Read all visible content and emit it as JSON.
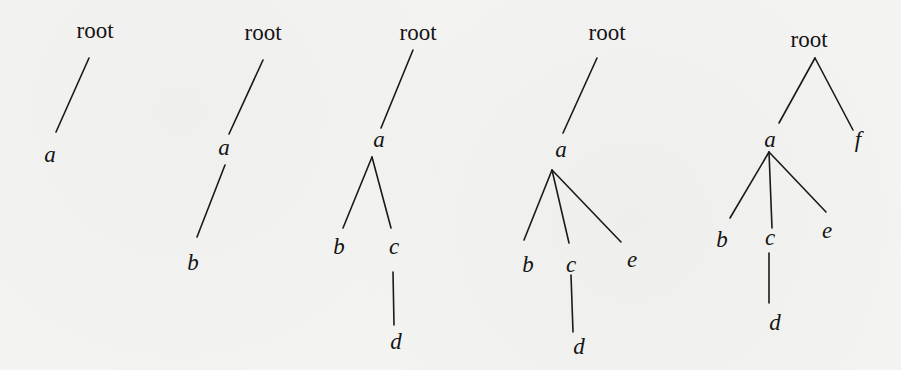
{
  "diagram": {
    "title": "",
    "colors": {
      "background": "#f3f3f1",
      "ink": "#141414"
    },
    "trees": [
      {
        "id": "tree-1",
        "nodes": [
          {
            "id": "root",
            "label": "root",
            "x": 95,
            "y": 38,
            "style": "roman"
          },
          {
            "id": "a",
            "label": "a",
            "x": 50,
            "y": 162,
            "style": "italic"
          }
        ],
        "edges": [
          {
            "from": "root",
            "to": "a",
            "x1": 89,
            "y1": 58,
            "x2": 56,
            "y2": 132
          }
        ]
      },
      {
        "id": "tree-2",
        "nodes": [
          {
            "id": "root",
            "label": "root",
            "x": 263,
            "y": 40,
            "style": "roman"
          },
          {
            "id": "a",
            "label": "a",
            "x": 224,
            "y": 155,
            "style": "italic"
          },
          {
            "id": "b",
            "label": "b",
            "x": 193,
            "y": 270,
            "style": "italic"
          }
        ],
        "edges": [
          {
            "from": "root",
            "to": "a",
            "x1": 263,
            "y1": 60,
            "x2": 229,
            "y2": 134
          },
          {
            "from": "a",
            "to": "b",
            "x1": 225,
            "y1": 165,
            "x2": 197,
            "y2": 237
          }
        ]
      },
      {
        "id": "tree-3",
        "nodes": [
          {
            "id": "root",
            "label": "root",
            "x": 418,
            "y": 40,
            "style": "roman"
          },
          {
            "id": "a",
            "label": "a",
            "x": 379,
            "y": 147,
            "style": "italic"
          },
          {
            "id": "b",
            "label": "b",
            "x": 339,
            "y": 254,
            "style": "italic"
          },
          {
            "id": "c",
            "label": "c",
            "x": 394,
            "y": 254,
            "style": "italic"
          },
          {
            "id": "d",
            "label": "d",
            "x": 396,
            "y": 349,
            "style": "italic"
          }
        ],
        "edges": [
          {
            "from": "root",
            "to": "a",
            "x1": 413,
            "y1": 50,
            "x2": 381,
            "y2": 128
          },
          {
            "from": "a",
            "to": "b",
            "x1": 372,
            "y1": 157,
            "x2": 343,
            "y2": 228
          },
          {
            "from": "a",
            "to": "c",
            "x1": 372,
            "y1": 157,
            "x2": 391,
            "y2": 228
          },
          {
            "from": "c",
            "to": "d",
            "x1": 393,
            "y1": 272,
            "x2": 394,
            "y2": 325
          }
        ]
      },
      {
        "id": "tree-4",
        "nodes": [
          {
            "id": "root",
            "label": "root",
            "x": 607,
            "y": 40,
            "style": "roman"
          },
          {
            "id": "a",
            "label": "a",
            "x": 561,
            "y": 157,
            "style": "italic"
          },
          {
            "id": "b",
            "label": "b",
            "x": 528,
            "y": 272,
            "style": "italic"
          },
          {
            "id": "c",
            "label": "c",
            "x": 571,
            "y": 272,
            "style": "italic"
          },
          {
            "id": "e",
            "label": "e",
            "x": 632,
            "y": 267,
            "style": "italic"
          },
          {
            "id": "d",
            "label": "d",
            "x": 579,
            "y": 354,
            "style": "italic"
          }
        ],
        "edges": [
          {
            "from": "root",
            "to": "a",
            "x1": 597,
            "y1": 58,
            "x2": 563,
            "y2": 133
          },
          {
            "from": "a",
            "to": "b",
            "x1": 552,
            "y1": 170,
            "x2": 524,
            "y2": 240
          },
          {
            "from": "a",
            "to": "c",
            "x1": 552,
            "y1": 170,
            "x2": 569,
            "y2": 243
          },
          {
            "from": "a",
            "to": "e",
            "x1": 552,
            "y1": 170,
            "x2": 621,
            "y2": 242
          },
          {
            "from": "c",
            "to": "d",
            "x1": 571,
            "y1": 275,
            "x2": 573,
            "y2": 332
          }
        ]
      },
      {
        "id": "tree-5",
        "nodes": [
          {
            "id": "root",
            "label": "root",
            "x": 809,
            "y": 47,
            "style": "roman"
          },
          {
            "id": "a",
            "label": "a",
            "x": 770,
            "y": 147,
            "style": "italic"
          },
          {
            "id": "f",
            "label": "f",
            "x": 858,
            "y": 147,
            "style": "italic"
          },
          {
            "id": "b",
            "label": "b",
            "x": 722,
            "y": 247,
            "style": "italic"
          },
          {
            "id": "c",
            "label": "c",
            "x": 770,
            "y": 245,
            "style": "italic"
          },
          {
            "id": "e",
            "label": "e",
            "x": 827,
            "y": 238,
            "style": "italic"
          },
          {
            "id": "d",
            "label": "d",
            "x": 775,
            "y": 330,
            "style": "italic"
          }
        ],
        "edges": [
          {
            "from": "root",
            "to": "a",
            "x1": 815,
            "y1": 58,
            "x2": 779,
            "y2": 123
          },
          {
            "from": "root",
            "to": "f",
            "x1": 815,
            "y1": 58,
            "x2": 853,
            "y2": 130
          },
          {
            "from": "a",
            "to": "b",
            "x1": 769,
            "y1": 152,
            "x2": 730,
            "y2": 218
          },
          {
            "from": "a",
            "to": "c",
            "x1": 769,
            "y1": 152,
            "x2": 772,
            "y2": 228
          },
          {
            "from": "a",
            "to": "e",
            "x1": 769,
            "y1": 152,
            "x2": 826,
            "y2": 212
          },
          {
            "from": "c",
            "to": "d",
            "x1": 769,
            "y1": 253,
            "x2": 769,
            "y2": 303
          }
        ]
      }
    ]
  }
}
